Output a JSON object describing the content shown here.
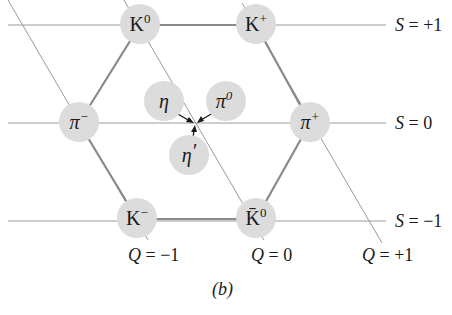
{
  "diagram": {
    "caption": "(b)",
    "strangeness_lines": [
      {
        "label_var": "S",
        "label_eq": " = +1",
        "y": 25
      },
      {
        "label_var": "S",
        "label_eq": " = 0",
        "y": 123
      },
      {
        "label_var": "S",
        "label_eq": " = −1",
        "y": 221
      }
    ],
    "charge_lines": [
      {
        "label_var": "Q",
        "label_eq": " = −1"
      },
      {
        "label_var": "Q",
        "label_eq": " = 0"
      },
      {
        "label_var": "Q",
        "label_eq": " = +1"
      }
    ],
    "particles": {
      "K0": {
        "base": "K",
        "sup": "0"
      },
      "Kplus": {
        "base": "K",
        "sup": "+"
      },
      "piminus": {
        "base": "π",
        "sup": "−"
      },
      "piplus": {
        "base": "π",
        "sup": "+"
      },
      "Kminus": {
        "base": "K",
        "sup": "−"
      },
      "K0bar": {
        "base": "K̄",
        "sup": "0"
      },
      "eta": {
        "base": "η",
        "sup": ""
      },
      "pi0": {
        "base": "π",
        "sup": "0"
      },
      "etaprime": {
        "base": "η",
        "sup": "′"
      }
    },
    "colors": {
      "node_fill": "#dcdcdc",
      "hexagon_stroke": "#8a8a8a",
      "grid_stroke": "#9a9a9a",
      "text": "#1a1a1a"
    }
  }
}
